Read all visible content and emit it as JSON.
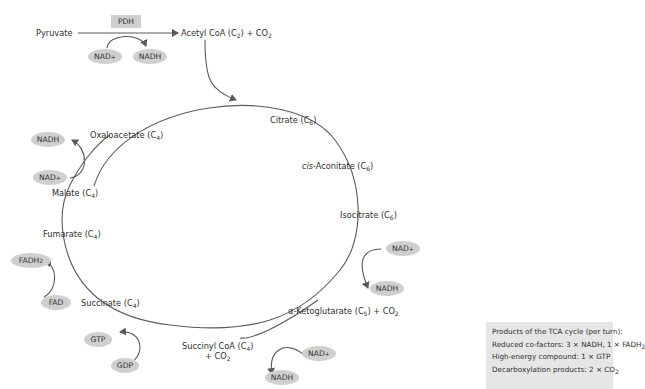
{
  "entry": {
    "pyruvate": "Pyruvate",
    "enzyme": "PDH",
    "acetyl_coa": "Acetyl CoA (C",
    "acetyl_coa_sub": "2",
    "acetyl_coa_tail": ") + CO",
    "acetyl_coa_co2_sub": "2",
    "nad": "NAD",
    "nad_sup": "+",
    "nadh": "NADH"
  },
  "cycle": {
    "citrate": {
      "name": "Citrate (C",
      "sub": "6",
      "tail": ")"
    },
    "cis_aconitate": {
      "prefix": "cis",
      "name": "-Aconitate (C",
      "sub": "6",
      "tail": ")"
    },
    "isocitrate": {
      "name": "Isocitrate (C",
      "sub": "6",
      "tail": ")"
    },
    "alpha_kg": {
      "name": "α-Ketoglutarate (C",
      "sub": "5",
      "tail": ") + CO",
      "sub2": "2"
    },
    "succinyl_coa": {
      "name": "Succinyl CoA (C",
      "sub": "4",
      "tail": ")",
      "line2": "+ CO",
      "sub2": "2"
    },
    "succinate": {
      "name": "Succinate (C",
      "sub": "4",
      "tail": ")"
    },
    "fumarate": {
      "name": "Fumarate (C",
      "sub": "4",
      "tail": ")"
    },
    "malate": {
      "name": "Malate (C",
      "sub": "4",
      "tail": ")"
    },
    "oxaloacetate": {
      "name": "Oxaloacetate (C",
      "sub": "4",
      "tail": ")"
    }
  },
  "cofactors": {
    "nad": "NAD",
    "nad_sup": "+",
    "nadh": "NADH",
    "fad": "FAD",
    "fadh": "FADH",
    "fadh_sub": "2",
    "gtp": "GTP",
    "gdp": "GDP"
  },
  "summary": {
    "title": "Products of the TCA cycle (per turn):",
    "line1": "Reduced co-factors: 3 × NADH, 1 × FADH",
    "line1_sub": "2",
    "line2": "High-energy compound: 1 × GTP",
    "line3": "Decarboxylation products: 2 × CO",
    "line3_sub": "2"
  },
  "colors": {
    "arrow": "#5a5a5a",
    "pill": "#cfcfcf",
    "summary_bg": "#e6e6e6",
    "text": "#2f2f2f"
  }
}
